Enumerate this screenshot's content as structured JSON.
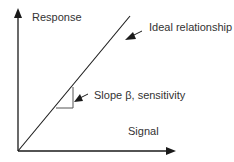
{
  "diagram": {
    "y_axis_label": "Response",
    "x_axis_label": "Signal",
    "line_label": "Ideal relationship",
    "slope_label": "Slope β, sensitivity",
    "colors": {
      "stroke": "#1a1a1a",
      "triangle": "#555555",
      "text": "#333333",
      "background": "#ffffff"
    }
  }
}
